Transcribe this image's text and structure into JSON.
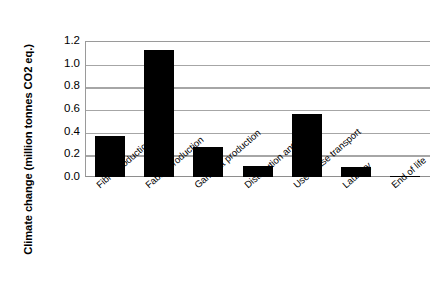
{
  "chart_data": {
    "type": "bar",
    "title": "",
    "xlabel": "",
    "ylabel": "Climate change  (million tonnes CO2 eq.)",
    "ylim": [
      0.0,
      1.2
    ],
    "ytick_labels": [
      "1.2",
      "1.0",
      "0.8",
      "0.6",
      "0.4",
      "0.2",
      "0.0"
    ],
    "ytick_values": [
      1.2,
      1.0,
      0.8,
      0.6,
      0.4,
      0.2,
      0.0
    ],
    "grid": true,
    "legend": "none",
    "bar_color": "#000000",
    "grid_color": "#a6a6a6",
    "categories": [
      "Fibre production",
      "Fabric production",
      "Garment production",
      "Distribution and retail",
      "Use phase transport",
      "Laundry",
      "End of life"
    ],
    "values": [
      0.365,
      1.12,
      0.265,
      0.095,
      0.555,
      0.09,
      0.012
    ]
  }
}
